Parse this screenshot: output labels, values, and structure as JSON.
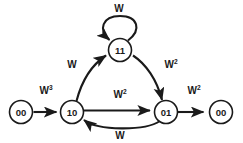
{
  "diagram": {
    "type": "state-machine",
    "background_color": "#ffffff",
    "stroke_color": "#1a1a1a",
    "nodes": [
      {
        "id": "start",
        "label": "00",
        "cx": 21,
        "cy": 112,
        "r": 11.5
      },
      {
        "id": "s10",
        "label": "10",
        "cx": 72,
        "cy": 112,
        "r": 11.5
      },
      {
        "id": "s11",
        "label": "11",
        "cx": 120,
        "cy": 50,
        "r": 11.5
      },
      {
        "id": "s01",
        "label": "01",
        "cx": 166,
        "cy": 112,
        "r": 11.5
      },
      {
        "id": "end",
        "label": "00",
        "cx": 221,
        "cy": 112,
        "r": 11.5
      }
    ],
    "edges": [
      {
        "id": "e-start-10",
        "from": "start",
        "to": "s10",
        "base": "W",
        "exponent": "3",
        "label_x": 46,
        "label_y": 94,
        "shape": "straight"
      },
      {
        "id": "e-10-11",
        "from": "s10",
        "to": "s11",
        "base": "W",
        "exponent": "",
        "label_x": 72,
        "label_y": 68,
        "shape": "curve-up"
      },
      {
        "id": "e-11-01",
        "from": "s11",
        "to": "s01",
        "base": "W",
        "exponent": "2",
        "label_x": 171,
        "label_y": 68,
        "shape": "curve-down"
      },
      {
        "id": "e-10-01",
        "from": "s10",
        "to": "s01",
        "base": "W",
        "exponent": "2",
        "label_x": 120,
        "label_y": 98,
        "shape": "straight"
      },
      {
        "id": "e-01-10",
        "from": "s01",
        "to": "s10",
        "base": "W",
        "exponent": "",
        "label_x": 120,
        "label_y": 139,
        "shape": "curve-below"
      },
      {
        "id": "e-01-end",
        "from": "s01",
        "to": "end",
        "base": "W",
        "exponent": "2",
        "label_x": 194,
        "label_y": 94,
        "shape": "straight"
      },
      {
        "id": "e-11-11",
        "from": "s11",
        "to": "s11",
        "base": "W",
        "exponent": "",
        "label_x": 119,
        "label_y": 12,
        "shape": "self-loop"
      }
    ]
  }
}
